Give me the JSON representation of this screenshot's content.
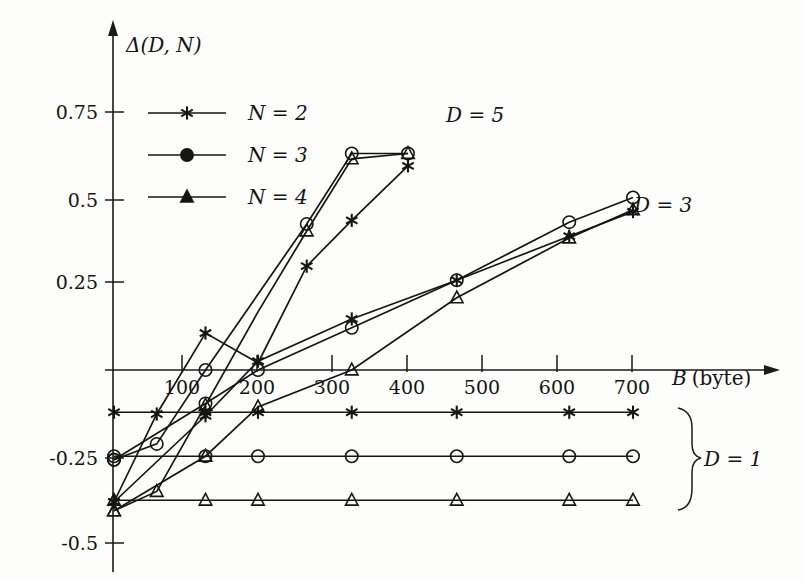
{
  "figure": {
    "yaxis_title": "Δ(D, N)",
    "xaxis_title_var": "B",
    "xaxis_title_unit": "(byte)",
    "background_color": "#fdfdfb",
    "ink_color": "#151515"
  },
  "axes": {
    "y_tick_labels": [
      "0.75",
      "0.5",
      "0.25",
      "-0.25",
      "-0.5"
    ],
    "x_tick_labels": [
      "100",
      "200",
      "300",
      "400",
      "500",
      "600",
      "700"
    ]
  },
  "legend": {
    "entries": [
      {
        "label": "N = 2",
        "marker": "star-marker"
      },
      {
        "label": "N = 3",
        "marker": "circle-marker"
      },
      {
        "label": "N = 4",
        "marker": "triangle-marker"
      }
    ]
  },
  "group_labels": {
    "d5": "D = 5",
    "d3": "D = 3",
    "d1": "D = 1"
  },
  "chart_data": {
    "type": "line",
    "title": "",
    "xlabel": "B (byte)",
    "ylabel": "Δ(D, N)",
    "xlim": [
      0,
      780
    ],
    "ylim": [
      -0.5,
      0.85
    ],
    "grid": false,
    "legend_position": "upper-left-inside",
    "y_ticks": [
      0.75,
      0.5,
      0.25,
      -0.25,
      -0.5
    ],
    "x_ticks": [
      100,
      200,
      300,
      400,
      500,
      600,
      700
    ],
    "groups": [
      {
        "name": "D = 5",
        "series": [
          {
            "name": "N = 2",
            "marker": "star",
            "x": [
              8,
              65,
              130,
              200,
              265,
              325,
              400
            ],
            "y": [
              -0.375,
              -0.125,
              0.105,
              0.02,
              0.295,
              0.425,
              0.58
            ]
          },
          {
            "name": "N = 3",
            "marker": "circle",
            "x": [
              8,
              65,
              130,
              200,
              265,
              325,
              400
            ],
            "y": [
              -0.255,
              -0.21,
              0.0,
              0.215,
              0.415,
              0.615,
              0.615
            ]
          },
          {
            "name": "N = 4",
            "marker": "triangle",
            "x": [
              8,
              65,
              130,
              200,
              265,
              325,
              400
            ],
            "y": [
              -0.4,
              -0.345,
              -0.1,
              0.165,
              0.395,
              0.6,
              0.615
            ]
          }
        ]
      },
      {
        "name": "D = 3",
        "series": [
          {
            "name": "N = 2",
            "marker": "star",
            "x": [
              8,
              130,
              200,
              325,
              465,
              615,
              700
            ],
            "y": [
              -0.375,
              -0.13,
              0.025,
              0.145,
              0.255,
              0.38,
              0.45
            ]
          },
          {
            "name": "N = 3",
            "marker": "circle",
            "x": [
              8,
              130,
              200,
              325,
              465,
              615,
              700
            ],
            "y": [
              -0.255,
              -0.095,
              0.0,
              0.12,
              0.255,
              0.42,
              0.49
            ]
          },
          {
            "name": "N = 4",
            "marker": "triangle",
            "x": [
              8,
              130,
              200,
              325,
              465,
              615,
              700
            ],
            "y": [
              -0.4,
              -0.245,
              -0.105,
              0.0,
              0.205,
              0.375,
              0.455
            ]
          }
        ]
      },
      {
        "name": "D = 1",
        "series": [
          {
            "name": "N = 2",
            "marker": "star",
            "x": [
              8,
              130,
              200,
              325,
              465,
              615,
              700
            ],
            "y": [
              -0.12,
              -0.12,
              -0.12,
              -0.12,
              -0.12,
              -0.12,
              -0.12
            ]
          },
          {
            "name": "N = 3",
            "marker": "circle",
            "x": [
              8,
              130,
              200,
              325,
              465,
              615,
              700
            ],
            "y": [
              -0.245,
              -0.245,
              -0.245,
              -0.245,
              -0.245,
              -0.245,
              -0.245
            ]
          },
          {
            "name": "N = 4",
            "marker": "triangle",
            "x": [
              8,
              130,
              200,
              325,
              465,
              615,
              700
            ],
            "y": [
              -0.37,
              -0.37,
              -0.37,
              -0.37,
              -0.37,
              -0.37,
              -0.37
            ]
          }
        ]
      }
    ]
  }
}
